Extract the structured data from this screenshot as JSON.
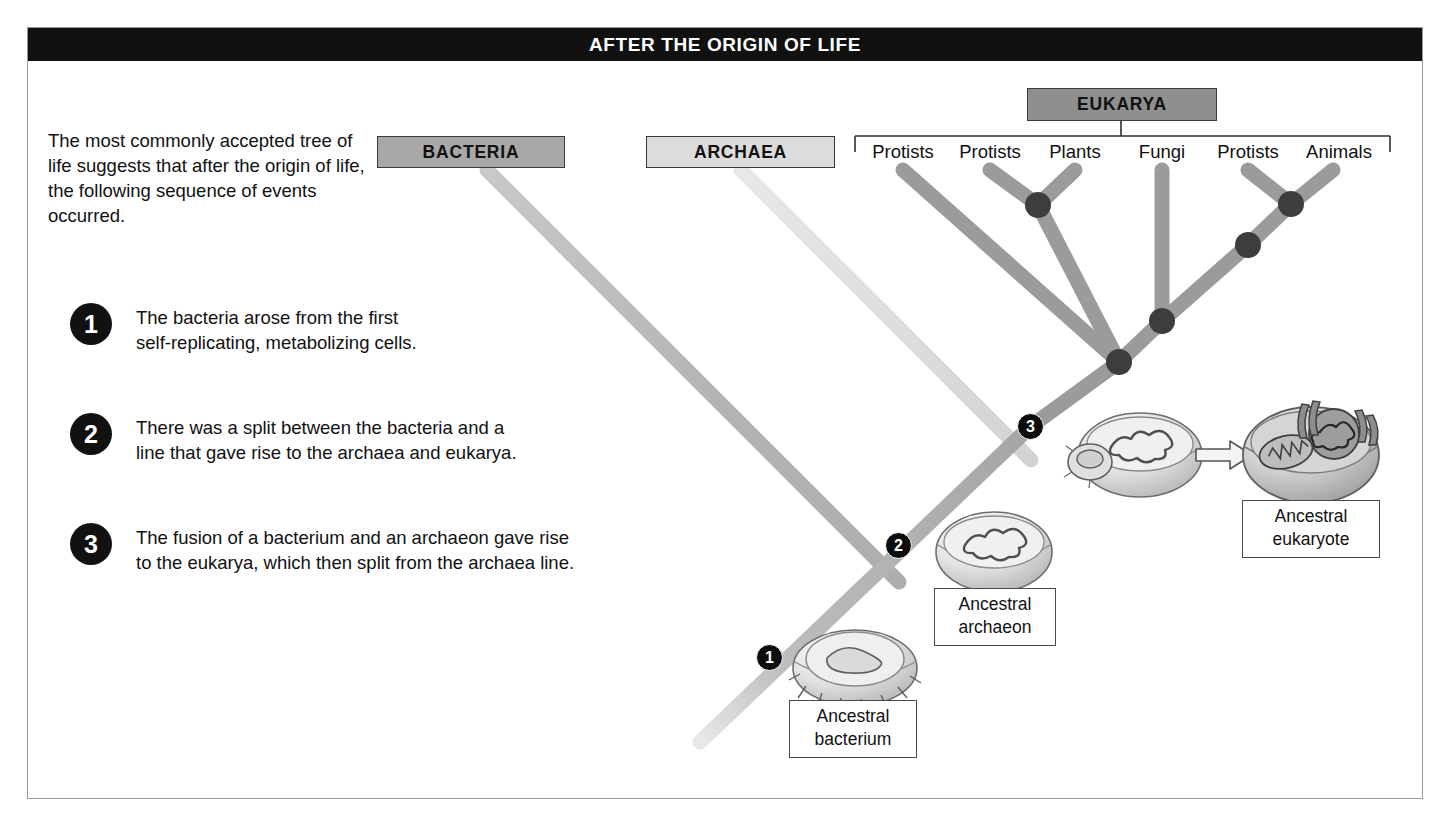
{
  "header": {
    "title": "AFTER THE ORIGIN OF LIFE"
  },
  "intro": {
    "text": "The most commonly accepted tree of life suggests that after the origin of life, the following sequence of events occurred."
  },
  "steps": [
    {
      "number": "1",
      "text": "The bacteria arose from the first\nself-replicating, metabolizing cells."
    },
    {
      "number": "2",
      "text": "There was a split between the bacteria and a\nline that gave rise to the archaea and eukarya."
    },
    {
      "number": "3",
      "text": "The fusion of a bacterium and an archaeon gave rise\nto the eukarya, which then split from the archaea line."
    }
  ],
  "domains": {
    "bacteria": "BACTERIA",
    "archaea": "ARCHAEA",
    "eukarya": "EUKARYA"
  },
  "leaves": [
    {
      "label": "Protists"
    },
    {
      "label": "Protists"
    },
    {
      "label": "Plants"
    },
    {
      "label": "Fungi"
    },
    {
      "label": "Protists"
    },
    {
      "label": "Animals"
    }
  ],
  "cell_captions": {
    "bacterium": "Ancestral\nbacterium",
    "archaeon": "Ancestral\narchaeon",
    "eukaryote": "Ancestral\neukaryote"
  },
  "markers": [
    {
      "number": "1"
    },
    {
      "number": "2"
    },
    {
      "number": "3"
    }
  ],
  "colors": {
    "header_bar": "#111111",
    "bacteria_box": "#a8a8a8",
    "archaea_box": "#dcdcdc",
    "eukarya_box": "#8f8f8f",
    "bacteria_branch": "#b6b6b6",
    "archaea_branch": "#e2e2e2",
    "eukarya_branch": "#9b9b9b",
    "node_fill": "#3d3d3d",
    "frame_border": "#9a9a9a"
  }
}
